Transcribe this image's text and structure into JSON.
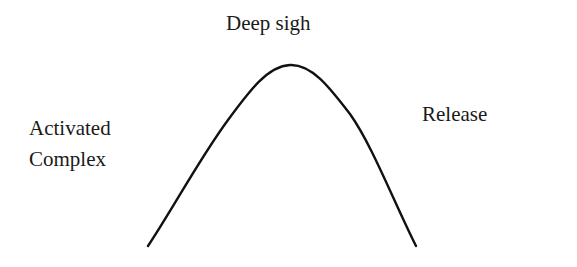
{
  "diagram": {
    "type": "bell-curve",
    "labels": {
      "peak": "Deep sigh",
      "left_line1": "Activated",
      "left_line2": "Complex",
      "right": "Release"
    },
    "curve": {
      "stroke_color": "#111111",
      "stroke_width": 2.4
    }
  }
}
